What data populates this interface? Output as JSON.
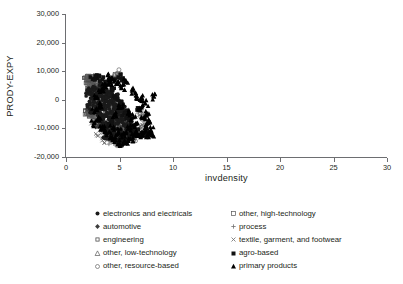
{
  "chart_data": {
    "type": "scatter",
    "title": "",
    "xlabel": "invdensity",
    "ylabel": "PRODY-EXPY",
    "xlim": [
      0,
      30
    ],
    "ylim": [
      -20000,
      30000
    ],
    "xticks": [
      "0",
      "5",
      "10",
      "15",
      "20",
      "25",
      "30"
    ],
    "xtick_values": [
      0,
      5,
      10,
      15,
      20,
      25,
      30
    ],
    "yticks": [
      "30,000",
      "20,000",
      "10,000",
      "0",
      "-10,000",
      "-20,000"
    ],
    "ytick_values": [
      30000,
      20000,
      10000,
      0,
      -10000,
      -20000
    ],
    "grid": false,
    "legend_position": "below-plot, two columns",
    "series": [
      {
        "name": "electronics and electricals",
        "marker": "filled-circle",
        "color": "#1a1a1a",
        "points": [
          [
            2.3,
            3100
          ],
          [
            2.5,
            1200
          ],
          [
            2.6,
            -900
          ],
          [
            2.7,
            4200
          ],
          [
            2.8,
            600
          ],
          [
            2.9,
            -2600
          ],
          [
            3.0,
            2100
          ],
          [
            3.05,
            -4800
          ],
          [
            3.1,
            -700
          ],
          [
            3.2,
            3400
          ],
          [
            3.25,
            -1900
          ],
          [
            3.3,
            -6100
          ],
          [
            3.4,
            900
          ],
          [
            3.45,
            -3300
          ],
          [
            3.5,
            -8200
          ],
          [
            3.55,
            2600
          ],
          [
            3.6,
            -1100
          ],
          [
            3.7,
            -5400
          ],
          [
            3.75,
            400
          ],
          [
            3.8,
            -9100
          ],
          [
            3.9,
            -2200
          ],
          [
            3.95,
            1700
          ],
          [
            4.0,
            -6800
          ],
          [
            4.1,
            -300
          ],
          [
            4.15,
            -11200
          ],
          [
            4.2,
            -4100
          ],
          [
            4.3,
            2200
          ],
          [
            4.35,
            -7600
          ],
          [
            4.4,
            -1500
          ],
          [
            4.5,
            -9800
          ],
          [
            4.55,
            500
          ],
          [
            4.6,
            -5100
          ],
          [
            4.7,
            -12400
          ],
          [
            4.75,
            -2700
          ],
          [
            4.8,
            1100
          ],
          [
            4.9,
            -7900
          ],
          [
            4.95,
            -4300
          ],
          [
            5.0,
            -10600
          ],
          [
            5.1,
            -1200
          ],
          [
            5.2,
            -6200
          ],
          [
            5.25,
            -13100
          ],
          [
            5.3,
            -3100
          ],
          [
            5.4,
            -8700
          ],
          [
            5.5,
            -11800
          ],
          [
            5.6,
            -5600
          ],
          [
            5.7,
            -14200
          ],
          [
            5.8,
            -9400
          ],
          [
            5.9,
            -7100
          ],
          [
            6.0,
            -12600
          ],
          [
            6.2,
            -10200
          ],
          [
            2.1,
            2400
          ],
          [
            2.2,
            -1600
          ],
          [
            2.4,
            -3900
          ],
          [
            3.15,
            5100
          ],
          [
            3.65,
            -12800
          ],
          [
            4.25,
            -8900
          ],
          [
            4.85,
            -14600
          ],
          [
            5.35,
            -15100
          ],
          [
            6.4,
            -11400
          ]
        ]
      },
      {
        "name": "automotive",
        "marker": "filled-diamond",
        "color": "#3c3c3c",
        "points": [
          [
            2.4,
            2600
          ],
          [
            2.7,
            -1400
          ],
          [
            2.9,
            4100
          ],
          [
            3.1,
            -3600
          ],
          [
            3.3,
            1300
          ],
          [
            3.5,
            -6400
          ],
          [
            3.7,
            2900
          ],
          [
            3.9,
            -4900
          ],
          [
            4.1,
            -1800
          ],
          [
            4.3,
            -8100
          ],
          [
            4.5,
            600
          ],
          [
            4.7,
            -6900
          ],
          [
            4.9,
            -3200
          ],
          [
            5.1,
            -10100
          ],
          [
            5.3,
            -5800
          ],
          [
            5.5,
            -12200
          ],
          [
            5.7,
            -8400
          ],
          [
            5.9,
            -11100
          ],
          [
            6.1,
            -13400
          ],
          [
            2.2,
            -2900
          ],
          [
            3.0,
            -9400
          ],
          [
            4.0,
            -11600
          ],
          [
            5.0,
            -14100
          ],
          [
            6.3,
            -10400
          ]
        ]
      },
      {
        "name": "engineering",
        "marker": "small-open-square",
        "color": "#4d4d4d",
        "points": [
          [
            2.0,
            5900
          ],
          [
            2.2,
            4200
          ],
          [
            2.4,
            6100
          ],
          [
            2.6,
            2700
          ],
          [
            2.8,
            5100
          ],
          [
            3.0,
            3200
          ],
          [
            3.2,
            -1100
          ],
          [
            3.4,
            4600
          ],
          [
            3.6,
            -2400
          ],
          [
            3.8,
            1900
          ],
          [
            4.0,
            -4600
          ],
          [
            4.2,
            -900
          ],
          [
            4.4,
            -7100
          ],
          [
            4.6,
            -2900
          ],
          [
            4.8,
            -9200
          ],
          [
            5.0,
            -5400
          ],
          [
            5.2,
            -11400
          ],
          [
            5.4,
            -7800
          ],
          [
            5.6,
            -13200
          ],
          [
            5.8,
            -9900
          ],
          [
            1.9,
            7400
          ],
          [
            2.1,
            -4100
          ],
          [
            2.5,
            -6600
          ],
          [
            3.5,
            -10700
          ],
          [
            4.5,
            -12900
          ],
          [
            6.0,
            -12100
          ],
          [
            2.05,
            -4900
          ],
          [
            2.15,
            6800
          ]
        ]
      },
      {
        "name": "other, low-technology",
        "marker": "open-triangle",
        "color": "#595959",
        "points": [
          [
            2.1,
            7600
          ],
          [
            2.3,
            3900
          ],
          [
            2.6,
            5400
          ],
          [
            2.9,
            1100
          ],
          [
            3.2,
            2900
          ],
          [
            3.5,
            -2100
          ],
          [
            3.8,
            -5200
          ],
          [
            4.1,
            -1200
          ],
          [
            4.4,
            -6800
          ],
          [
            4.7,
            -3700
          ],
          [
            5.0,
            -9100
          ],
          [
            5.3,
            -6100
          ],
          [
            5.6,
            -11600
          ],
          [
            5.9,
            -8800
          ],
          [
            6.2,
            -12400
          ],
          [
            2.4,
            -4400
          ],
          [
            3.0,
            -8100
          ],
          [
            4.0,
            -10200
          ],
          [
            4.9,
            -13100
          ]
        ]
      },
      {
        "name": "other, resource-based",
        "marker": "open-circle",
        "color": "#666666",
        "points": [
          [
            4.95,
            10500
          ],
          [
            2.2,
            4900
          ],
          [
            2.8,
            6400
          ],
          [
            3.4,
            1800
          ],
          [
            4.0,
            -2400
          ],
          [
            4.6,
            -5900
          ],
          [
            5.2,
            -8600
          ],
          [
            5.8,
            -11200
          ],
          [
            6.4,
            -13600
          ],
          [
            7.2,
            -5800
          ],
          [
            7.35,
            -6400
          ],
          [
            2.5,
            -1100
          ],
          [
            3.1,
            -7200
          ],
          [
            3.9,
            -9800
          ],
          [
            5.5,
            -14100
          ],
          [
            6.9,
            -4900
          ]
        ]
      },
      {
        "name": "other, high-technology",
        "marker": "open-square",
        "color": "#555555",
        "points": [
          [
            4.6,
            8800
          ],
          [
            2.0,
            7900
          ],
          [
            2.35,
            8100
          ],
          [
            2.7,
            7700
          ],
          [
            3.0,
            8200
          ],
          [
            2.05,
            -4600
          ],
          [
            2.25,
            -5100
          ],
          [
            2.5,
            5800
          ],
          [
            3.3,
            6200
          ],
          [
            3.9,
            3100
          ],
          [
            4.4,
            -1900
          ],
          [
            5.0,
            -6400
          ],
          [
            5.6,
            -9700
          ],
          [
            6.1,
            -12100
          ],
          [
            2.15,
            -4200
          ],
          [
            7.5,
            -11900
          ]
        ]
      },
      {
        "name": "process",
        "marker": "plus",
        "color": "#707070",
        "points": [
          [
            2.6,
            4100
          ],
          [
            3.0,
            1900
          ],
          [
            3.4,
            -1400
          ],
          [
            3.8,
            -4100
          ],
          [
            4.2,
            -7200
          ],
          [
            4.6,
            -9400
          ],
          [
            5.0,
            -11900
          ],
          [
            5.4,
            -13800
          ],
          [
            2.9,
            -6200
          ],
          [
            3.6,
            -8900
          ],
          [
            4.4,
            -12400
          ],
          [
            5.2,
            -15100
          ],
          [
            4.1,
            -14600
          ],
          [
            4.8,
            -15400
          ]
        ]
      },
      {
        "name": "textile, garment, and footwear",
        "marker": "cross",
        "color": "#6b6b6b",
        "points": [
          [
            2.4,
            2200
          ],
          [
            2.8,
            -1900
          ],
          [
            3.2,
            -5400
          ],
          [
            3.6,
            -8400
          ],
          [
            4.0,
            -10900
          ],
          [
            4.4,
            -13400
          ],
          [
            4.8,
            -14800
          ],
          [
            3.0,
            -12600
          ],
          [
            3.4,
            -14200
          ],
          [
            5.2,
            -12900
          ],
          [
            7.1,
            -8900
          ],
          [
            6.9,
            -9200
          ],
          [
            2.6,
            -7600
          ]
        ]
      },
      {
        "name": "agro-based",
        "marker": "filled-square",
        "color": "#111111",
        "points": [
          [
            4.9,
            7900
          ],
          [
            5.3,
            7400
          ],
          [
            2.5,
            7200
          ],
          [
            2.9,
            7600
          ],
          [
            3.4,
            7100
          ],
          [
            3.8,
            5200
          ],
          [
            4.3,
            3900
          ],
          [
            4.6,
            1100
          ],
          [
            5.1,
            -1400
          ],
          [
            5.5,
            -4600
          ],
          [
            5.9,
            -7200
          ],
          [
            6.3,
            -9600
          ],
          [
            6.6,
            -11400
          ],
          [
            7.0,
            -12100
          ],
          [
            7.4,
            -11600
          ],
          [
            7.6,
            -11200
          ],
          [
            6.1,
            -13100
          ],
          [
            5.0,
            -13900
          ],
          [
            6.8,
            -3600
          ],
          [
            7.2,
            -12600
          ],
          [
            4.2,
            -8200
          ],
          [
            3.6,
            -10400
          ]
        ]
      },
      {
        "name": "primary products",
        "marker": "filled-triangle",
        "color": "#000000",
        "points": [
          [
            3.9,
            8600
          ],
          [
            4.3,
            7800
          ],
          [
            4.1,
            6100
          ],
          [
            3.6,
            4900
          ],
          [
            4.7,
            5600
          ],
          [
            5.2,
            4100
          ],
          [
            5.6,
            6400
          ],
          [
            6.2,
            3200
          ],
          [
            6.6,
            1400
          ],
          [
            7.1,
            600
          ],
          [
            8.2,
            1100
          ],
          [
            7.4,
            -1200
          ],
          [
            6.9,
            -2900
          ],
          [
            7.6,
            -4900
          ],
          [
            7.3,
            -6200
          ],
          [
            7.8,
            -7400
          ],
          [
            7.5,
            -9100
          ],
          [
            7.9,
            -10600
          ],
          [
            7.2,
            -11400
          ],
          [
            6.8,
            -12400
          ],
          [
            6.4,
            -11900
          ],
          [
            6.0,
            -13600
          ],
          [
            5.5,
            -14400
          ],
          [
            5.0,
            -15200
          ],
          [
            4.6,
            -14100
          ],
          [
            4.2,
            -12900
          ],
          [
            3.8,
            -11600
          ],
          [
            3.4,
            -9400
          ],
          [
            3.0,
            -6900
          ],
          [
            2.7,
            -4100
          ],
          [
            3.2,
            -2100
          ],
          [
            2.9,
            900
          ],
          [
            3.3,
            3100
          ],
          [
            2.6,
            -8200
          ],
          [
            4.9,
            -11100
          ],
          [
            5.8,
            -10100
          ],
          [
            6.5,
            -8400
          ],
          [
            5.4,
            -12100
          ],
          [
            4.4,
            -9900
          ],
          [
            7.7,
            -12000
          ],
          [
            8.0,
            -12400
          ],
          [
            6.3,
            -6100
          ],
          [
            5.9,
            -4400
          ],
          [
            5.1,
            -2600
          ],
          [
            4.5,
            -5400
          ]
        ]
      }
    ]
  },
  "legend": {
    "left_column": [
      {
        "marker": "filled-circle",
        "label": "electronics and electricals"
      },
      {
        "marker": "filled-diamond",
        "label": "automotive"
      },
      {
        "marker": "small-open-square",
        "label": "engineering"
      },
      {
        "marker": "open-triangle",
        "label": "other, low-technology"
      },
      {
        "marker": "open-circle",
        "label": "other, resource-based"
      }
    ],
    "right_column": [
      {
        "marker": "open-square",
        "label": "other, high-technology"
      },
      {
        "marker": "plus",
        "label": "process"
      },
      {
        "marker": "cross",
        "label": "textile, garment, and footwear"
      },
      {
        "marker": "filled-square",
        "label": "agro-based"
      },
      {
        "marker": "filled-triangle",
        "label": "primary products"
      }
    ]
  },
  "colors": {
    "axis": "#6d6e71",
    "text": "#231f20",
    "marker_dark": "#000000",
    "marker_gray": "#666666"
  }
}
